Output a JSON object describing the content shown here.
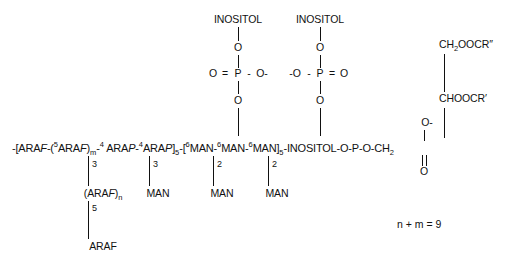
{
  "figure": {
    "type": "chemical-structure",
    "note": "n + m = 9"
  },
  "main_chain": {
    "segments": [
      {
        "text": "-[ARA",
        "style": "plain"
      },
      {
        "text": "F",
        "style": "italic"
      },
      {
        "text": "-(",
        "style": "plain"
      },
      {
        "text": "5",
        "style": "sup"
      },
      {
        "text": "ARA",
        "style": "plain"
      },
      {
        "text": "F",
        "style": "italic"
      },
      {
        "text": ")",
        "style": "plain"
      },
      {
        "text": "m",
        "style": "sub"
      },
      {
        "text": "-",
        "style": "plain"
      },
      {
        "text": "4",
        "style": "sup"
      },
      {
        "text": " ARA",
        "style": "plain"
      },
      {
        "text": "P",
        "style": "italic"
      },
      {
        "text": "-",
        "style": "plain"
      },
      {
        "text": "4",
        "style": "sup"
      },
      {
        "text": "ARA",
        "style": "plain"
      },
      {
        "text": "P",
        "style": "italic"
      },
      {
        "text": "]",
        "style": "plain"
      },
      {
        "text": "5",
        "style": "sub"
      },
      {
        "text": "-[",
        "style": "plain"
      },
      {
        "text": "6",
        "style": "sup"
      },
      {
        "text": "MAN-",
        "style": "plain"
      },
      {
        "text": "6",
        "style": "sup"
      },
      {
        "text": "MAN-",
        "style": "plain"
      },
      {
        "text": "6",
        "style": "sup"
      },
      {
        "text": "MAN]",
        "style": "plain"
      },
      {
        "text": "5",
        "style": "sub"
      },
      {
        "text": "-INOSITOL-O-P-O-CH",
        "style": "plain"
      },
      {
        "text": "2",
        "style": "sub"
      }
    ],
    "plain_text": "-[ARAF-(5ARAF)m-4 ARAP-4ARAP]5-[6MAN-6MAN-6MAN]5-INOSITOL-O-P-O-CH2"
  },
  "branches": {
    "arabinan_branch": {
      "linkage_top": "3",
      "label_prefix": "(ARA",
      "label_italic": "F",
      "label_suffix": ")",
      "label_sub": "n",
      "linkage_bottom": "5",
      "terminal": "ARAF"
    },
    "man_branch_1": {
      "linkage": "3",
      "label": "MAN"
    },
    "man_branch_2": {
      "linkage": "2",
      "label": "MAN"
    },
    "man_branch_3": {
      "linkage": "2",
      "label": "MAN"
    }
  },
  "phosphate_left": {
    "top_label": "INOSITOL",
    "bridge_o": "O",
    "double_bond_o": "O",
    "equals": "=",
    "p": "P",
    "dash": "-",
    "anion_o": "O-",
    "bottom_o": "O"
  },
  "phosphate_right": {
    "top_label": "INOSITOL",
    "bridge_o": "O",
    "anion_o": "-O",
    "dash": "-",
    "p": "P",
    "equals": "=",
    "double_bond_o": "O",
    "bottom_o": "O"
  },
  "phosphodiester": {
    "anion_o": "O-",
    "p": "P",
    "carbonyl_o": "O"
  },
  "glyceride": {
    "position_1": "CH",
    "position_1_sub": "2",
    "position_1_rest": "OOCR″",
    "position_2": "CHOOCR′"
  },
  "colors": {
    "ink": "#111111",
    "background": "#ffffff"
  }
}
